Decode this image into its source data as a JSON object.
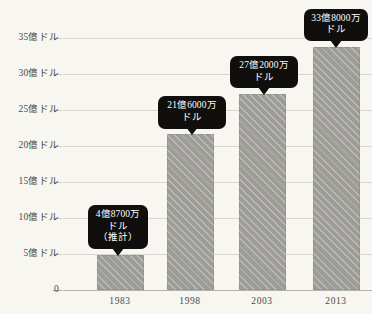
{
  "chart_data": {
    "type": "bar",
    "title": "",
    "subtitle": "",
    "xlabel": "",
    "ylabel": "",
    "categories": [
      "1983",
      "1998",
      "2003",
      "2013"
    ],
    "values": [
      4.87,
      21.6,
      27.2,
      33.8
    ],
    "unit": "億ドル",
    "ylim": [
      0,
      36
    ],
    "grid": true,
    "legend": "none",
    "y_ticks": [
      {
        "value": 35,
        "label": "35億ドル"
      },
      {
        "value": 30,
        "label": "30億ドル"
      },
      {
        "value": 25,
        "label": "25億ドル"
      },
      {
        "value": 20,
        "label": "20億ドル"
      },
      {
        "value": 15,
        "label": "15億ドル"
      },
      {
        "value": 10,
        "label": "10億ドル"
      },
      {
        "value": 5,
        "label": "5億ドル"
      },
      {
        "value": 0,
        "label": "0"
      }
    ],
    "annotations": [
      {
        "category": "1983",
        "value": 4.87,
        "lines": [
          "4億8700万",
          "ドル",
          "（推計）"
        ]
      },
      {
        "category": "1998",
        "value": 21.6,
        "lines": [
          "21億6000万",
          "ドル"
        ]
      },
      {
        "category": "2003",
        "value": 27.2,
        "lines": [
          "27億2000万",
          "ドル"
        ]
      },
      {
        "category": "2013",
        "value": 33.8,
        "lines": [
          "33億8000万",
          "ドル"
        ]
      }
    ],
    "colors": {
      "background": "#f8f6f1",
      "bar_fill": "#9d9c97",
      "bar_hatch": "#c5c4bf",
      "gridline": "#d8d6d0",
      "axis": "#b3b1ab",
      "callout_bg": "#100f0d",
      "callout_text": "#ffffff",
      "tick_text": "#4b4943"
    }
  }
}
